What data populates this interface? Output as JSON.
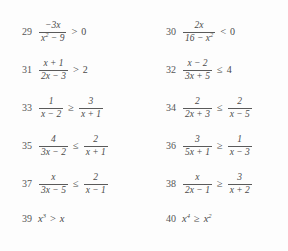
{
  "page": {
    "type": "textbook-exercise-set",
    "layout": "two-column",
    "background_color": "#fdfdfd",
    "text_color": "#4a4a4a"
  },
  "problems": [
    {
      "number": "29",
      "column": "left",
      "form": "fraction-vs-constant",
      "numerator": "−3x",
      "denominator_pre": "x",
      "denominator_exp": "2",
      "denominator_post": " − 9",
      "relation": ">",
      "right": "0",
      "plain_text": "−3x / (x² − 9) > 0"
    },
    {
      "number": "30",
      "column": "right",
      "form": "fraction-vs-constant",
      "numerator": "2x",
      "denominator_pre": "16 − x",
      "denominator_exp": "2",
      "denominator_post": "",
      "relation": "<",
      "right": "0",
      "plain_text": "2x / (16 − x²) < 0"
    },
    {
      "number": "31",
      "column": "left",
      "form": "fraction-vs-constant",
      "numerator": "x + 1",
      "denominator_pre": "2x − 3",
      "denominator_exp": "",
      "denominator_post": "",
      "relation": ">",
      "right": "2",
      "plain_text": "(x + 1) / (2x − 3) > 2"
    },
    {
      "number": "32",
      "column": "right",
      "form": "fraction-vs-constant",
      "numerator": "x − 2",
      "denominator_pre": "3x + 5",
      "denominator_exp": "",
      "denominator_post": "",
      "relation": "≤",
      "right": "4",
      "plain_text": "(x − 2) / (3x + 5) ≤ 4"
    },
    {
      "number": "33",
      "column": "left",
      "form": "fraction-vs-fraction",
      "left_num": "1",
      "left_den": "x − 2",
      "relation": "≥",
      "right_num": "3",
      "right_den": "x + 1",
      "plain_text": "1 / (x − 2) ≥ 3 / (x + 1)"
    },
    {
      "number": "34",
      "column": "right",
      "form": "fraction-vs-fraction",
      "left_num": "2",
      "left_den": "2x + 3",
      "relation": "≤",
      "right_num": "2",
      "right_den": "x − 5",
      "plain_text": "2 / (2x + 3) ≤ 2 / (x − 5)"
    },
    {
      "number": "35",
      "column": "left",
      "form": "fraction-vs-fraction",
      "left_num": "4",
      "left_den": "3x − 2",
      "relation": "≤",
      "right_num": "2",
      "right_den": "x + 1",
      "plain_text": "4 / (3x − 2) ≤ 2 / (x + 1)"
    },
    {
      "number": "36",
      "column": "right",
      "form": "fraction-vs-fraction",
      "left_num": "3",
      "left_den": "5x + 1",
      "relation": "≥",
      "right_num": "1",
      "right_den": "x − 3",
      "plain_text": "3 / (5x + 1) ≥ 1 / (x − 3)"
    },
    {
      "number": "37",
      "column": "left",
      "form": "fraction-vs-fraction",
      "left_num": "x",
      "left_den": "3x − 5",
      "relation": "≤",
      "right_num": "2",
      "right_den": "x − 1",
      "plain_text": "x / (3x − 5) ≤ 2 / (x − 1)"
    },
    {
      "number": "38",
      "column": "right",
      "form": "fraction-vs-fraction",
      "left_num": "x",
      "left_den": "2x − 1",
      "relation": "≥",
      "right_num": "3",
      "right_den": "x + 2",
      "plain_text": "x / (2x − 1) ≥ 3 / (x + 2)"
    },
    {
      "number": "39",
      "column": "left",
      "form": "power-inline",
      "left_base": "x",
      "left_exp": "3",
      "relation": ">",
      "right_base": "x",
      "right_exp": "",
      "plain_text": "x³ > x"
    },
    {
      "number": "40",
      "column": "right",
      "form": "power-inline",
      "left_base": "x",
      "left_exp": "4",
      "relation": "≥",
      "right_base": "x",
      "right_exp": "2",
      "plain_text": "x⁴ ≥ x²"
    }
  ]
}
